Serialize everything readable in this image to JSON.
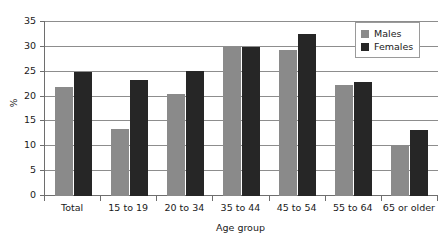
{
  "chart_data": {
    "type": "bar",
    "title": "",
    "subtitle": "",
    "xlabel": "Age group",
    "ylabel": "%",
    "ylim": [
      0,
      35
    ],
    "ytick_step": 5,
    "grid": true,
    "legend_position": "top-right",
    "categories": [
      "Total",
      "15 to 19",
      "20 to 34",
      "35 to 44",
      "45 to 54",
      "55 to 64",
      "65 or older"
    ],
    "series": [
      {
        "name": "Males",
        "color": "#8a8a8a",
        "values": [
          22.0,
          13.5,
          20.5,
          30.0,
          29.3,
          22.3,
          10.3
        ]
      },
      {
        "name": "Females",
        "color": "#262626",
        "values": [
          25.0,
          23.3,
          25.2,
          30.0,
          32.6,
          23.0,
          13.3
        ]
      }
    ],
    "yticks": [
      "0",
      "5",
      "10",
      "15",
      "20",
      "25",
      "30",
      "35"
    ]
  },
  "legend": {
    "items": [
      {
        "label": "Males"
      },
      {
        "label": "Females"
      }
    ]
  },
  "axes": {
    "y_label": "%",
    "x_label": "Age group"
  }
}
